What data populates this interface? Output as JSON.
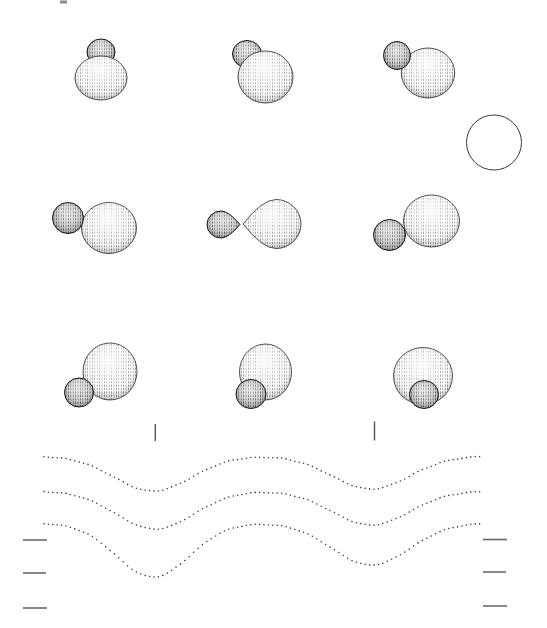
{
  "figure": {
    "label": "binary-star-phase-figure",
    "width": 547,
    "height": 628,
    "background": "#ffffff"
  },
  "palette": {
    "ink": "#2f2f2f",
    "outline_large": "#2a2a2a",
    "outline_small": "#141414",
    "phase_tick": "#555555",
    "scale_tick": "#6a6a6a",
    "curve_dot": "#3d3d3d",
    "circle_stroke": "#3a3a3a",
    "artifact": "#8a8a8a"
  },
  "artifact_mark": {
    "x": 60,
    "y": 0.5,
    "w": 7,
    "h": 3
  },
  "reference_circle": {
    "cx": 494,
    "cy": 142.5,
    "r": 27.5
  },
  "binary_pairs": [
    {
      "name": "binary-pair-phase-1",
      "small_in_front": false,
      "large": {
        "shape": "ellipse",
        "cx": 101,
        "cy": 78,
        "rx": 26,
        "ry": 22
      },
      "small": {
        "shape": "ellipse",
        "cx": 101,
        "cy": 52,
        "rx": 14,
        "ry": 13
      }
    },
    {
      "name": "binary-pair-phase-2",
      "small_in_front": false,
      "large": {
        "shape": "ellipse",
        "cx": 265.5,
        "cy": 77,
        "rx": 27.5,
        "ry": 26
      },
      "small": {
        "shape": "ellipse",
        "cx": 247,
        "cy": 54,
        "rx": 14.5,
        "ry": 13.5
      }
    },
    {
      "name": "binary-pair-phase-3",
      "small_in_front": true,
      "large": {
        "shape": "ellipse",
        "cx": 428,
        "cy": 73,
        "rx": 26.7,
        "ry": 25
      },
      "small": {
        "shape": "ellipse",
        "cx": 397,
        "cy": 55.5,
        "rx": 13.5,
        "ry": 14
      }
    },
    {
      "name": "binary-pair-phase-4",
      "small_in_front": true,
      "large": {
        "shape": "ellipse",
        "cx": 109,
        "cy": 228,
        "rx": 27.5,
        "ry": 25.5
      },
      "small": {
        "shape": "ellipse",
        "cx": 68,
        "cy": 218,
        "rx": 15.5,
        "ry": 15.5
      }
    },
    {
      "name": "binary-pair-phase-5",
      "small_in_front": false,
      "large": {
        "shape": "drop",
        "cx": 276,
        "cy": 224,
        "rx": 25,
        "ry": 24.5,
        "tip_x": 243,
        "side": "left"
      },
      "small": {
        "shape": "drop",
        "cx": 221,
        "cy": 224.5,
        "rx": 14,
        "ry": 13.5,
        "tip_x": 240,
        "side": "right"
      }
    },
    {
      "name": "binary-pair-phase-6",
      "small_in_front": true,
      "large": {
        "shape": "ellipse",
        "cx": 431.5,
        "cy": 221,
        "rx": 28,
        "ry": 26
      },
      "small": {
        "shape": "ellipse",
        "cx": 389.5,
        "cy": 235,
        "rx": 16,
        "ry": 15.5
      }
    },
    {
      "name": "binary-pair-phase-7",
      "small_in_front": true,
      "large": {
        "shape": "ellipse",
        "cx": 110,
        "cy": 371.5,
        "rx": 27,
        "ry": 28.5
      },
      "small": {
        "shape": "ellipse",
        "cx": 79,
        "cy": 392.5,
        "rx": 14.5,
        "ry": 14.5
      }
    },
    {
      "name": "binary-pair-phase-8",
      "small_in_front": true,
      "large": {
        "shape": "ellipse",
        "cx": 265.5,
        "cy": 372,
        "rx": 26,
        "ry": 28
      },
      "small": {
        "shape": "ellipse",
        "cx": 251,
        "cy": 394,
        "rx": 15,
        "ry": 14.5
      }
    },
    {
      "name": "binary-pair-phase-9",
      "small_in_front": true,
      "large": {
        "shape": "ellipse",
        "cx": 423,
        "cy": 376,
        "rx": 29.5,
        "ry": 28.5
      },
      "small": {
        "shape": "ellipse",
        "cx": 424,
        "cy": 394.5,
        "rx": 14.5,
        "ry": 14
      }
    }
  ],
  "phase_ticks": [
    {
      "x": 155.3,
      "y1": 424,
      "y2": 441
    },
    {
      "x": 374.5,
      "y1": 421.5,
      "y2": 440.5
    }
  ],
  "scale_ticks_left": [
    {
      "x1": 23,
      "x2": 47,
      "y": 540
    },
    {
      "x1": 23,
      "x2": 46,
      "y": 573
    },
    {
      "x1": 23,
      "x2": 47,
      "y": 608
    }
  ],
  "scale_ticks_right": [
    {
      "x1": 483,
      "x2": 507,
      "y": 539.5
    },
    {
      "x1": 483,
      "x2": 506,
      "y": 572
    },
    {
      "x1": 483,
      "x2": 507,
      "y": 606
    }
  ],
  "light_curves": {
    "type": "scatter",
    "description": "three dotted eclipsing-binary light curves; primary minima aligned with left phase tick, shallower secondary minima with right phase tick",
    "x_start": 44,
    "x_end": 480,
    "dot_step": 4.4,
    "dot_radius": 0.8,
    "curves": [
      {
        "baseline_y": 456,
        "dips": [
          {
            "x": 153,
            "depth": 35,
            "width": 55
          },
          {
            "x": 371,
            "depth": 33,
            "width": 55
          }
        ]
      },
      {
        "baseline_y": 491,
        "dips": [
          {
            "x": 155,
            "depth": 38,
            "width": 55
          },
          {
            "x": 371,
            "depth": 34,
            "width": 55
          }
        ]
      },
      {
        "baseline_y": 523,
        "dips": [
          {
            "x": 153,
            "depth": 54,
            "width": 52
          },
          {
            "x": 371,
            "depth": 42,
            "width": 55
          }
        ]
      }
    ]
  }
}
